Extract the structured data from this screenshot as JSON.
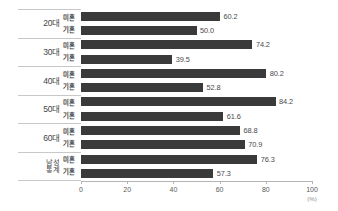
{
  "chart_data": {
    "type": "bar",
    "orientation": "horizontal",
    "title": "",
    "xlabel": "(%)",
    "ylabel": "",
    "xlim": [
      0,
      100
    ],
    "grid": false,
    "legend": "row-labels",
    "categories": [
      "20대",
      "30대",
      "40대",
      "50대",
      "60대",
      "남성 통계"
    ],
    "series": [
      {
        "name": "미혼",
        "values": [
          60.2,
          74.2,
          80.2,
          84.2,
          68.8,
          76.3
        ]
      },
      {
        "name": "기혼",
        "values": [
          50.0,
          39.5,
          52.8,
          61.6,
          70.9,
          57.3
        ]
      }
    ],
    "value_labels": [
      [
        "60.2",
        "50.0"
      ],
      [
        "74.2",
        "39.5"
      ],
      [
        "80.2",
        "52.8"
      ],
      [
        "84.2",
        "61.6"
      ],
      [
        "68.8",
        "70.9"
      ],
      [
        "76.3",
        "57.3"
      ]
    ],
    "xticks": [
      0,
      20,
      40,
      60,
      80,
      100
    ],
    "xtick_labels": [
      "0",
      "20",
      "40",
      "60",
      "80",
      "100"
    ],
    "bar_color": "#3a3a3a",
    "axis_color": "#b4b4b4"
  },
  "axis": {
    "unit": "(%)"
  },
  "groups": [
    {
      "name": "20대",
      "name_line1": "20대",
      "name_line2": "",
      "rows": [
        {
          "series": "미혼",
          "value": 60.2,
          "label": "60.2"
        },
        {
          "series": "기혼",
          "value": 50.0,
          "label": "50.0"
        }
      ]
    },
    {
      "name": "30대",
      "name_line1": "30대",
      "name_line2": "",
      "rows": [
        {
          "series": "미혼",
          "value": 74.2,
          "label": "74.2"
        },
        {
          "series": "기혼",
          "value": 39.5,
          "label": "39.5"
        }
      ]
    },
    {
      "name": "40대",
      "name_line1": "40대",
      "name_line2": "",
      "rows": [
        {
          "series": "미혼",
          "value": 80.2,
          "label": "80.2"
        },
        {
          "series": "기혼",
          "value": 52.8,
          "label": "52.8"
        }
      ]
    },
    {
      "name": "50대",
      "name_line1": "50대",
      "name_line2": "",
      "rows": [
        {
          "series": "미혼",
          "value": 84.2,
          "label": "84.2"
        },
        {
          "series": "기혼",
          "value": 61.6,
          "label": "61.6"
        }
      ]
    },
    {
      "name": "60대",
      "name_line1": "60대",
      "name_line2": "",
      "rows": [
        {
          "series": "미혼",
          "value": 68.8,
          "label": "68.8"
        },
        {
          "series": "기혼",
          "value": 70.9,
          "label": "70.9"
        }
      ]
    },
    {
      "name": "남성 통계",
      "name_line1": "남성",
      "name_line2": "통계",
      "rows": [
        {
          "series": "미혼",
          "value": 76.3,
          "label": "76.3"
        },
        {
          "series": "기혼",
          "value": 57.3,
          "label": "57.3"
        }
      ]
    }
  ]
}
